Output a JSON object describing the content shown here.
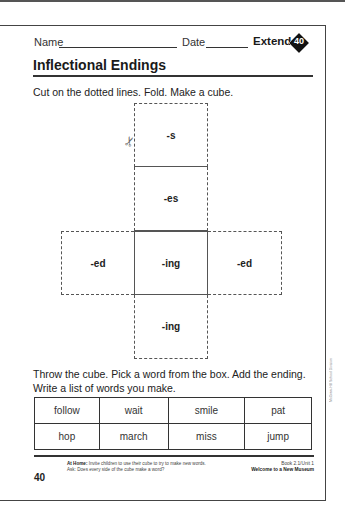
{
  "header": {
    "name_label": "Name",
    "date_label": "Date",
    "extend_label": "Extend",
    "lesson_number": "40"
  },
  "title": "Inflectional Endings",
  "instructions": {
    "step1": "Cut on the dotted lines. Fold. Make a cube.",
    "step2": "Throw the cube. Pick a word from the box. Add the ending. Write a list of words you make."
  },
  "cube_net": {
    "faces": [
      {
        "position": "top",
        "label": "-s"
      },
      {
        "position": "upper-middle",
        "label": "-es"
      },
      {
        "position": "left",
        "label": "-ed"
      },
      {
        "position": "center",
        "label": "-ing"
      },
      {
        "position": "right",
        "label": "-ed"
      },
      {
        "position": "bottom",
        "label": "-ing"
      }
    ],
    "icon": "scissors-icon"
  },
  "word_box": {
    "rows": [
      [
        "follow",
        "wait",
        "smile",
        "pat"
      ],
      [
        "hop",
        "march",
        "miss",
        "jump"
      ]
    ]
  },
  "footer": {
    "at_home_label": "At Home:",
    "at_home_text": "Invite children to use their cube to try to make new words. Ask: Does every side of the cube make a word?",
    "book_info": "Book 2.1/Unit 1",
    "book_title": "Welcome to a New Museum",
    "page_number": "40",
    "copyright": "McGraw-Hill School Division"
  }
}
